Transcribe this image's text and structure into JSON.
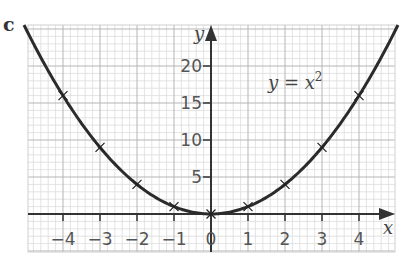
{
  "part_label": "c",
  "chart_data": {
    "type": "line",
    "title": "",
    "equation_label": "y = x²",
    "xlabel": "x",
    "ylabel": "y",
    "x_ticks": [
      -4,
      -3,
      -2,
      -1,
      0,
      1,
      2,
      3,
      4
    ],
    "x_tick_labels": [
      "−4",
      "−3",
      "−2",
      "−1",
      "0",
      "1",
      "2",
      "3",
      "4"
    ],
    "y_ticks": [
      5,
      10,
      15,
      20
    ],
    "y_tick_labels": [
      "5",
      "10",
      "15",
      "20"
    ],
    "xlim": [
      -4.95,
      4.95
    ],
    "ylim": [
      -5.2,
      25.5
    ],
    "grid": true,
    "series": [
      {
        "name": "y = x^2",
        "x": [
          -4,
          -3,
          -2,
          -1,
          0,
          1,
          2,
          3,
          4
        ],
        "y": [
          16,
          9,
          4,
          1,
          0,
          1,
          4,
          9,
          16
        ],
        "marker": "x",
        "curve": "smooth"
      }
    ],
    "legend": "none"
  }
}
